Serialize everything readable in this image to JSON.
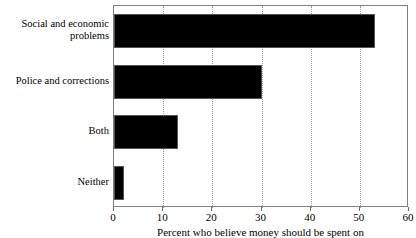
{
  "chart_data": {
    "type": "bar",
    "orientation": "horizontal",
    "title": "",
    "xlabel": "Percent who believe money should be spent on",
    "ylabel": "",
    "categories": [
      "Social and economic problems",
      "Police and corrections",
      "Both",
      "Neither"
    ],
    "values": [
      53,
      30,
      13,
      2
    ],
    "xlim": [
      0,
      60
    ],
    "xticks": [
      0,
      10,
      20,
      30,
      40,
      50,
      60
    ],
    "xtick_labels": [
      "0",
      "10",
      "20",
      "30",
      "40",
      "50",
      "60"
    ],
    "grid": "vertical-dotted",
    "legend": null,
    "bar_color": "#000000",
    "grid_color": "#9a9a9a",
    "frame_color": "#808080"
  },
  "category_lines": [
    [
      "Social and economic",
      "problems"
    ],
    [
      "Police and corrections"
    ],
    [
      "Both"
    ],
    [
      "Neither"
    ]
  ]
}
